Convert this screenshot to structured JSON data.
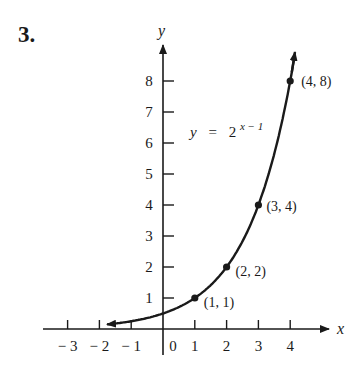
{
  "problem_number": "3.",
  "chart_data": {
    "type": "line",
    "title": "",
    "equation": {
      "lhs": "y",
      "eq": "=",
      "base": "2",
      "exponent": "x − 1"
    },
    "function": "y = 2^(x-1)",
    "xlabel": "x",
    "ylabel": "y",
    "xlim": [
      -3.7,
      5.1
    ],
    "ylim": [
      -0.5,
      8.8
    ],
    "x_ticks": [
      -3,
      -2,
      -1,
      0,
      1,
      2,
      3,
      4
    ],
    "x_tick_labels": [
      "− 3",
      "− 2",
      "− 1",
      "0",
      "1",
      "2",
      "3",
      "4"
    ],
    "y_ticks": [
      1,
      2,
      3,
      4,
      5,
      6,
      7,
      8
    ],
    "y_tick_labels": [
      "1",
      "2",
      "3",
      "4",
      "5",
      "6",
      "7",
      "8"
    ],
    "grid": false,
    "series": [
      {
        "name": "y = 2^(x-1)",
        "x": [
          -1.8,
          -1,
          0,
          1,
          2,
          3,
          4,
          4.15
        ],
        "y": [
          0.14,
          0.25,
          0.5,
          1,
          2,
          4,
          8,
          8.9
        ]
      }
    ],
    "labeled_points": [
      {
        "x": 1,
        "y": 1,
        "label": "(1, 1)"
      },
      {
        "x": 2,
        "y": 2,
        "label": "(2, 2)"
      },
      {
        "x": 3,
        "y": 4,
        "label": "(3, 4)"
      },
      {
        "x": 4,
        "y": 8,
        "label": "(4, 8)"
      }
    ]
  }
}
